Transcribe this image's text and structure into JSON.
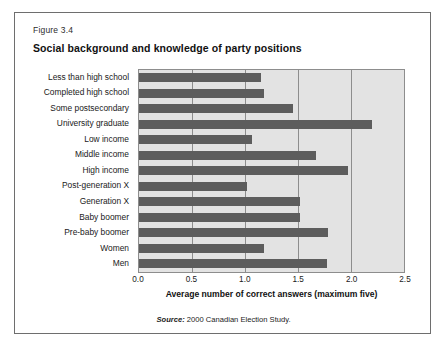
{
  "figure": {
    "number": "Figure 3.4",
    "title": "Social background and knowledge of party positions",
    "source_prefix": "Source:",
    "source_text": " 2000 Canadian Election Study."
  },
  "colors": {
    "bar": "#5d5d5d",
    "plot_background": "#e3e3e3",
    "gridline": "#8d8d8d",
    "border": "#6e6e6e",
    "text": "#1a1a1a"
  },
  "chart_data": {
    "type": "bar",
    "orientation": "horizontal",
    "title": "Social background and knowledge of party positions",
    "xlabel": "Average number of correct answers (maximum five)",
    "ylabel": "",
    "xlim": [
      0.0,
      2.5
    ],
    "xticks": [
      "0.0",
      "0.5",
      "1.0",
      "1.5",
      "2.0",
      "2.5"
    ],
    "xtick_values": [
      0.0,
      0.5,
      1.0,
      1.5,
      2.0,
      2.5
    ],
    "grid": true,
    "legend": "none",
    "categories": [
      "Less than high school",
      "Completed high school",
      "Some postsecondary",
      "University graduate",
      "Low income",
      "Middle income",
      "High income",
      "Post-generation X",
      "Generation X",
      "Baby boomer",
      "Pre-baby boomer",
      "Women",
      "Men"
    ],
    "values": [
      1.15,
      1.18,
      1.45,
      2.2,
      1.07,
      1.67,
      1.97,
      1.02,
      1.52,
      1.52,
      1.78,
      1.18,
      1.77
    ],
    "source": "Source: 2000 Canadian Election Study."
  }
}
